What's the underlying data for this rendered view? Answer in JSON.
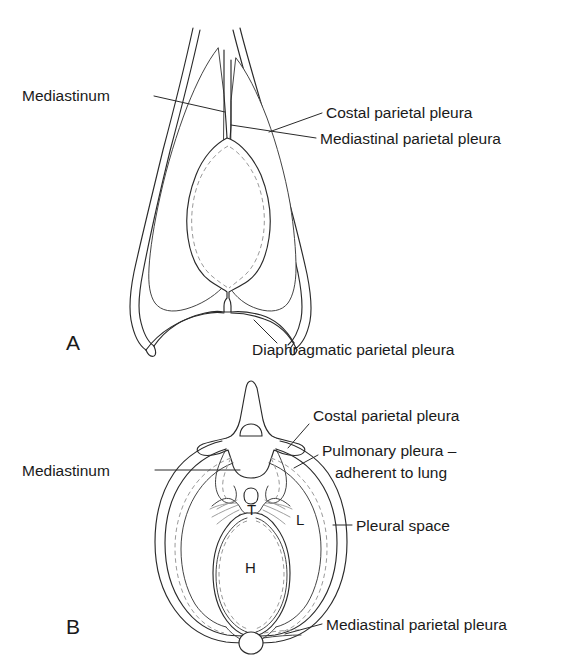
{
  "figure": {
    "background_color": "#ffffff",
    "line_color": "#2a2a2a",
    "dashed_line_color": "#9a9a9a"
  },
  "panel_a": {
    "letter": "A",
    "view": "coronal section of thorax",
    "labels": {
      "mediastinum": "Mediastinum",
      "costal_parietal_pleura": "Costal parietal pleura",
      "mediastinal_parietal_pleura": "Mediastinal parietal pleura",
      "diaphragmatic_parietal_pleura": "Diaphragmatic parietal pleura"
    }
  },
  "panel_b": {
    "letter": "B",
    "view": "transverse section of thorax",
    "labels": {
      "mediastinum": "Mediastinum",
      "costal_parietal_pleura": "Costal parietal pleura",
      "pulmonary_pleura_line1": "Pulmonary pleura –",
      "pulmonary_pleura_line2": "adherent to lung",
      "pleural_space": "Pleural space",
      "mediastinal_parietal_pleura": "Mediastinal parietal pleura"
    },
    "organ_markers": {
      "heart": "H",
      "lung": "L",
      "trachea": "T"
    }
  }
}
